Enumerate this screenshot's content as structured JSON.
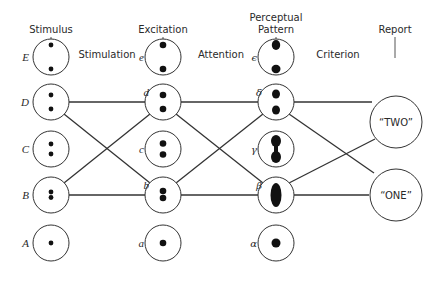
{
  "diagram": {
    "column_headers": {
      "stimulus": "Stimulus",
      "excitation": "Excitation",
      "perceptual_line1": "Perceptual",
      "perceptual_line2": "Pattern",
      "report": "Report"
    },
    "stage_labels": {
      "stimulation": "Stimulation",
      "attention": "Attention",
      "criterion": "Criterion"
    },
    "stimulus_nodes": [
      {
        "label": "E",
        "dots": "two far apart (top and bottom)"
      },
      {
        "label": "D",
        "dots": "two apart"
      },
      {
        "label": "C",
        "dots": "two close"
      },
      {
        "label": "B",
        "dots": "two touching"
      },
      {
        "label": "A",
        "dots": "one"
      }
    ],
    "excitation_nodes": [
      {
        "label": "e"
      },
      {
        "label": "d"
      },
      {
        "label": "c"
      },
      {
        "label": "b"
      },
      {
        "label": "a"
      }
    ],
    "pattern_nodes": [
      {
        "label": "ϵ"
      },
      {
        "label": "δ"
      },
      {
        "label": "γ"
      },
      {
        "label": "β"
      },
      {
        "label": "α"
      }
    ],
    "report_nodes": [
      {
        "label": "“TWO”"
      },
      {
        "label": "“ONE”"
      }
    ],
    "connections": [
      "D-d",
      "D-b",
      "B-d",
      "B-b",
      "d-δ",
      "d-β",
      "b-δ",
      "b-β",
      "δ-TWO",
      "δ-ONE",
      "β-TWO",
      "β-ONE"
    ]
  }
}
